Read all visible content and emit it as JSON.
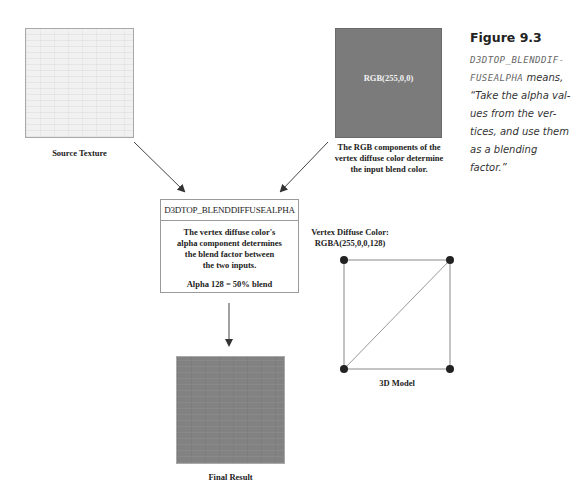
{
  "source_texture": {
    "caption": "Source Texture"
  },
  "diffuse_texture": {
    "label": "RGB(255,0,0)",
    "caption_lines": [
      "The RGB components of the",
      "vertex diffuse color determine",
      "the input blend color."
    ]
  },
  "blend_op": {
    "title": "D3DTOP_BLENDDIFFUSEALPHA",
    "body_lines": [
      "The vertex diffuse color's",
      "alpha component determines",
      "the blend factor between",
      "the two inputs."
    ],
    "alpha_note": "Alpha 128 = 50% blend"
  },
  "model": {
    "label_lines": [
      "Vertex Diffuse Color:",
      "RGBA(255,0,0,128)"
    ],
    "caption": "3D Model"
  },
  "final_result": {
    "caption": "Final Result"
  },
  "figure": {
    "title": "Figure 9.3",
    "mono_line1": "D3DTOP_BLENDDIF-",
    "mono_line2": "FUSEALPHA",
    "text_after_mono": " means,",
    "lines": [
      "“Take the alpha val-",
      "ues from the ver-",
      "tices, and use them",
      "as a blending",
      "factor.”"
    ]
  },
  "colors": {
    "diffuse_gray": "#7b7b7b",
    "final_gray": "#828282",
    "line": "#555555",
    "vertex_dot": "#222222"
  }
}
